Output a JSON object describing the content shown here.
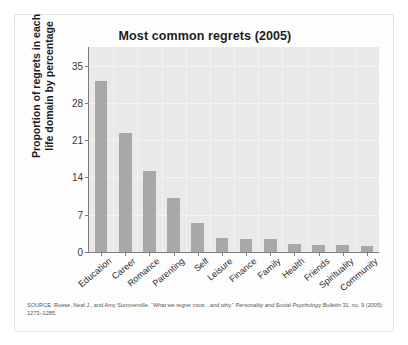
{
  "figure": {
    "background_color": "#ffffff",
    "card_background": "#fdfdfd"
  },
  "chart_data": {
    "type": "bar",
    "title": "Most common regrets (2005)",
    "xlabel": "",
    "ylabel": "Proportion of regrets in each life domain by percentage",
    "ylabel_line1": "Proportion of regrets in each",
    "ylabel_line2": "life domain by percentage",
    "categories": [
      "Education",
      "Career",
      "Romance",
      "Parenting",
      "Self",
      "Leisure",
      "Finance",
      "Family",
      "Health",
      "Friends",
      "Spirituality",
      "Community"
    ],
    "values": [
      32.2,
      22.3,
      15.2,
      10.2,
      5.5,
      2.6,
      2.5,
      2.4,
      1.5,
      1.4,
      1.3,
      1.2
    ],
    "ylim": [
      0,
      38.5
    ],
    "yticks": [
      0,
      7,
      14,
      21,
      28,
      35
    ],
    "ytick_labels": [
      "0",
      "7",
      "14",
      "21",
      "28",
      "35"
    ],
    "grid": true,
    "legend": "none",
    "bar_color": "#a8a8a8",
    "plot_background": "#e9e9e9",
    "axis_color": "#7d7d7d"
  },
  "source": {
    "prefix": "SOURCE: Roese, Neal J., and Amy Summerville. “What we regret most…and why.” ",
    "journal": "Personality and Social Psychology Bulletin",
    "suffix": " 31, no. 9 (2005): 1273–1285."
  }
}
